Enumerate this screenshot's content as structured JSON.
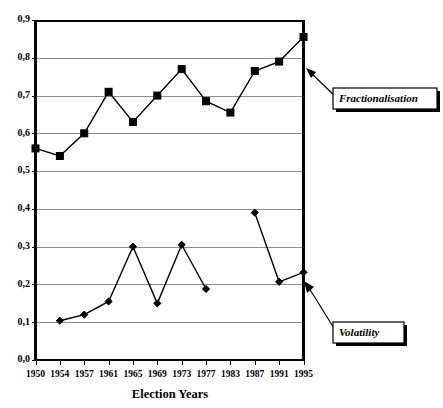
{
  "chart_data": {
    "type": "line",
    "title": "",
    "xlabel": "Election Years",
    "ylabel": "",
    "categories": [
      "1950",
      "1954",
      "1957",
      "1961",
      "1965",
      "1969",
      "1973",
      "1977",
      "1983",
      "1987",
      "1991",
      "1995"
    ],
    "xtick_labels": [
      "1950",
      "1954",
      "1957",
      "1961",
      "1965",
      "1969",
      "1973",
      "1977",
      "1983",
      "1987",
      "1991",
      "1995"
    ],
    "ytick_labels": [
      "0,0",
      "0,1",
      "0,2",
      "0,3",
      "0,4",
      "0,5",
      "0,6",
      "0,7",
      "0,8",
      "0,9"
    ],
    "ytick_values": [
      0.0,
      0.1,
      0.2,
      0.3,
      0.4,
      0.5,
      0.6,
      0.7,
      0.8,
      0.9
    ],
    "ylim": [
      0.0,
      0.9
    ],
    "grid": true,
    "legend_position": "callout-labels-right",
    "decimal_separator": ",",
    "series": [
      {
        "name": "Fractionalisation",
        "marker": "square",
        "values": [
          0.56,
          0.54,
          0.6,
          0.71,
          0.63,
          0.7,
          0.77,
          0.685,
          0.655,
          0.765,
          0.79,
          0.855
        ]
      },
      {
        "name": "Volatility",
        "marker": "diamond",
        "values": [
          null,
          0.104,
          0.12,
          0.155,
          0.3,
          0.15,
          0.305,
          0.188,
          null,
          0.39,
          0.207,
          0.232
        ]
      }
    ],
    "annotations": [
      {
        "label": "Fractionalisation",
        "points_to_series": "Fractionalisation"
      },
      {
        "label": "Volatility",
        "points_to_series": "Volatility"
      }
    ],
    "colors": {
      "line": "#000000",
      "grid": "#8c8c8c",
      "axis": "#000000",
      "background": "#ffffff"
    }
  },
  "axis": {
    "x_title": "Election Years"
  },
  "callouts": {
    "fractionalisation_label": "Fractionalisation",
    "volatility_label": "Volatility"
  }
}
